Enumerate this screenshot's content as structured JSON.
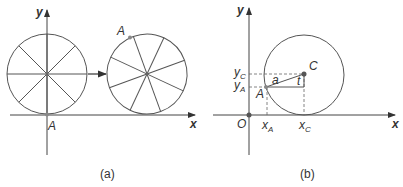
{
  "figure": {
    "panel_a": {
      "caption": "(a)",
      "axis_x_label": "x",
      "axis_y_label": "y",
      "point_label_start": "A",
      "point_label_rotated": "A",
      "wheel_spokes": 8,
      "description": "Wheel with point A at contact with x-axis, rolling right; after rolling, A is at upper-left of the wheel."
    },
    "panel_b": {
      "caption": "(b)",
      "axis_x_label": "x",
      "axis_y_label": "y",
      "origin_label": "O",
      "center_label": "C",
      "point_label": "A",
      "radius_label": "a",
      "angle_label": "t",
      "y_labels": [
        {
          "main": "y",
          "sub": "C"
        },
        {
          "main": "y",
          "sub": "A"
        }
      ],
      "x_labels": [
        {
          "main": "x",
          "sub": "A"
        },
        {
          "main": "x",
          "sub": "C"
        }
      ]
    },
    "colors": {
      "stroke": "#555555",
      "axis": "#444444",
      "text": "#333333",
      "dot": "#666666"
    }
  }
}
